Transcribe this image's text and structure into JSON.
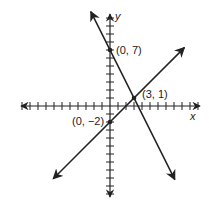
{
  "chart_data": {
    "type": "line",
    "title": "",
    "xlabel": "x",
    "ylabel": "y",
    "xlim": [
      -11,
      11
    ],
    "ylim": [
      -11,
      11
    ],
    "grid": false,
    "tick_interval": 1,
    "tick_labels_shown": false,
    "series": [
      {
        "name": "line-through-(0,7)-and-(3,1)",
        "slope": -2,
        "intercept": 7,
        "points": [
          [
            0,
            7
          ],
          [
            3,
            1
          ]
        ]
      },
      {
        "name": "line-through-(0,-2)-and-(3,1)",
        "slope": 1,
        "intercept": -2,
        "points": [
          [
            0,
            -2
          ],
          [
            3,
            1
          ]
        ]
      }
    ],
    "annotations": [
      {
        "label": "(0, 7)",
        "x": 0,
        "y": 7
      },
      {
        "label": "(3, 1)",
        "x": 3,
        "y": 1
      },
      {
        "label": "(0, −2)",
        "x": 0,
        "y": -2
      }
    ]
  },
  "labels": {
    "x_axis": "x",
    "y_axis": "y",
    "point_a": "(0, 7)",
    "point_b": "(3, 1)",
    "point_c": "(0, −2)"
  },
  "colors": {
    "ink": "#222222",
    "background": "#ffffff"
  }
}
